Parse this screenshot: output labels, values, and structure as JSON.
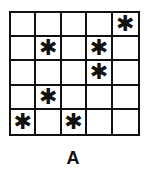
{
  "figure": {
    "label": "A",
    "rows": 5,
    "cols": 5,
    "mark_symbol": "✱",
    "mark_icon": "asterisk-icon",
    "grid": [
      [
        "",
        "",
        "",
        "",
        "✱"
      ],
      [
        "",
        "✱",
        "",
        "✱",
        ""
      ],
      [
        "",
        "",
        "",
        "✱",
        ""
      ],
      [
        "",
        "✱",
        "",
        "",
        ""
      ],
      [
        "✱",
        "",
        "✱",
        "",
        ""
      ]
    ],
    "marked_cells": [
      {
        "row": 1,
        "col": 5
      },
      {
        "row": 2,
        "col": 2
      },
      {
        "row": 2,
        "col": 4
      },
      {
        "row": 3,
        "col": 4
      },
      {
        "row": 4,
        "col": 2
      },
      {
        "row": 5,
        "col": 1
      },
      {
        "row": 5,
        "col": 3
      }
    ]
  }
}
